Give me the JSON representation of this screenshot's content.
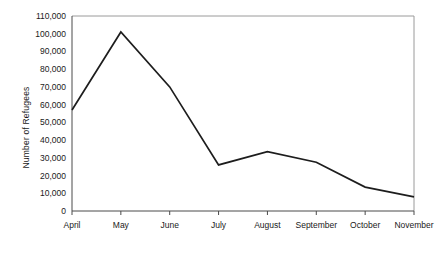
{
  "chart_data": {
    "type": "line",
    "title": "",
    "subtitle": "",
    "xlabel": "",
    "ylabel": "Number of Refugees",
    "categories": [
      "April",
      "May",
      "June",
      "July",
      "August",
      "September",
      "October",
      "November"
    ],
    "values": [
      57000,
      101000,
      70000,
      26000,
      33500,
      27500,
      13500,
      8000
    ],
    "series": [
      {
        "name": "Number of Refugees",
        "values": [
          57000,
          101000,
          70000,
          26000,
          33500,
          27500,
          13500,
          8000
        ]
      }
    ],
    "ylim": [
      0,
      110000
    ],
    "ytick_values": [
      0,
      10000,
      20000,
      30000,
      40000,
      50000,
      60000,
      70000,
      80000,
      90000,
      100000,
      110000
    ],
    "ytick_labels": [
      "0",
      "10,000",
      "20,000",
      "30,000",
      "40,000",
      "50,000",
      "60,000",
      "70,000",
      "80,000",
      "90,000",
      "100,000",
      "110,000"
    ],
    "grid": false,
    "legend": false,
    "legend_position": "none",
    "line_color": "#1d1d1d",
    "frame_color": "#9a9a9a",
    "axis_color": "#4a4a4a",
    "background_color": "#ffffff"
  }
}
